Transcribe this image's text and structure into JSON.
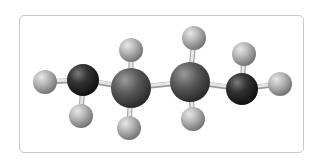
{
  "diagram": {
    "type": "ball-and-stick molecular model",
    "colors": {
      "frame_border": "#c8c8c8",
      "background": "#ffffff",
      "bond": "#e6e6e6",
      "bond_shadow": "#9a9a9a",
      "terminal_carbon": "#2a2a2a",
      "inner_carbon": "#555555",
      "hydrogen": "#a8a8a8"
    },
    "atoms": [
      {
        "id": "H1",
        "element": "H",
        "cx": 45,
        "cy": 82,
        "r": 12
      },
      {
        "id": "H2",
        "element": "H",
        "cx": 81,
        "cy": 116,
        "r": 12
      },
      {
        "id": "C1",
        "element": "C",
        "cx": 83,
        "cy": 80,
        "r": 16,
        "shade": "dark"
      },
      {
        "id": "H3",
        "element": "H",
        "cx": 131,
        "cy": 50,
        "r": 12
      },
      {
        "id": "H4",
        "element": "H",
        "cx": 129,
        "cy": 128,
        "r": 12
      },
      {
        "id": "C2",
        "element": "C",
        "cx": 131,
        "cy": 88,
        "r": 20,
        "shade": "medium"
      },
      {
        "id": "H5",
        "element": "H",
        "cx": 194,
        "cy": 38,
        "r": 12
      },
      {
        "id": "H6",
        "element": "H",
        "cx": 193,
        "cy": 119,
        "r": 12
      },
      {
        "id": "C3",
        "element": "C",
        "cx": 190,
        "cy": 82,
        "r": 20,
        "shade": "medium"
      },
      {
        "id": "H7",
        "element": "H",
        "cx": 244,
        "cy": 54,
        "r": 12
      },
      {
        "id": "H8",
        "element": "H",
        "cx": 280,
        "cy": 84,
        "r": 12
      },
      {
        "id": "C4",
        "element": "C",
        "cx": 242,
        "cy": 89,
        "r": 16,
        "shade": "dark"
      }
    ],
    "bonds": [
      [
        "H1",
        "C1"
      ],
      [
        "H2",
        "C1"
      ],
      [
        "C1",
        "C2"
      ],
      [
        "H3",
        "C2"
      ],
      [
        "H4",
        "C2"
      ],
      [
        "C2",
        "C3"
      ],
      [
        "H5",
        "C3"
      ],
      [
        "H6",
        "C3"
      ],
      [
        "C3",
        "C4"
      ],
      [
        "H7",
        "C4"
      ],
      [
        "H8",
        "C4"
      ]
    ]
  }
}
